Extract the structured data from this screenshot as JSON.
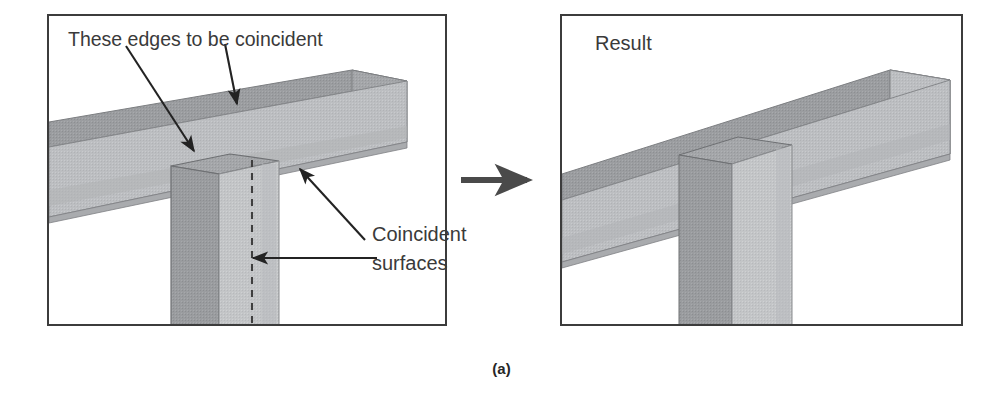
{
  "figure": {
    "caption": "(a)",
    "transition_arrow": "arrow-right-icon"
  },
  "panels": [
    {
      "id": "before",
      "name": "before-state",
      "labels": {
        "edges_note": "These edges to be coincident",
        "surfaces_note": "Coincident surfaces"
      },
      "annotations": [
        {
          "name": "edges-arrow-left",
          "points_to": "post-top-front-edge"
        },
        {
          "name": "edges-arrow-right",
          "points_to": "beam-top-edge"
        },
        {
          "name": "surfaces-arrow-upper",
          "points_to": "beam-underside-face"
        },
        {
          "name": "surfaces-arrow-lower",
          "points_to": "post-hidden-face"
        }
      ],
      "geometry": {
        "beam": "inclined-rectangular-beam",
        "post": "vertical-rectangular-post",
        "hidden_edge": "dashed-vertical-line"
      }
    },
    {
      "id": "after",
      "name": "result-state",
      "labels": {
        "title": "Result"
      },
      "geometry": {
        "beam": "inclined-rectangular-beam",
        "post": "vertical-rectangular-post-mated"
      }
    }
  ],
  "colors": {
    "panel_border": "#3c3c3c",
    "text": "#3a3a3a",
    "caption_text": "#262626",
    "arrow": "#4a4a4a",
    "beam_top_face": "#9b9da0",
    "beam_front_face": "#bcbec1",
    "beam_end_face": "#a9abae",
    "beam_bottom_face": "#b4b6b9",
    "post_left_face": "#9a9c9f",
    "post_front_face": "#c3c5c7",
    "post_top_face": "#a4a6a9",
    "edge_line": "#6e7073",
    "dashed_line": "#4a4a4a",
    "background": "#ffffff"
  }
}
